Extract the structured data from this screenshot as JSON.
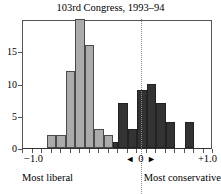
{
  "chart_data": {
    "type": "bar",
    "title": "103rd Congress, 1993–94",
    "xlabel": "",
    "ylabel": "",
    "xlim": [
      -1.0,
      1.0
    ],
    "ylim": [
      0,
      20
    ],
    "grid": false,
    "legend_position": "none",
    "bin_width": 0.1,
    "x_tick_labels": [
      "−1.0",
      "0",
      "+1.0"
    ],
    "y_tick_labels": [
      "0",
      "5",
      "10",
      "15"
    ],
    "y_ticks": [
      0,
      5,
      10,
      15
    ],
    "annotations": {
      "left_caption": "Most liberal",
      "right_caption": "Most conservative",
      "zero_marker": "0",
      "zero_marker_left_arrow": "◄",
      "zero_marker_right_arrow": "►"
    },
    "colors": {
      "liberal_fill": "#ababab",
      "conservative_fill": "#333333",
      "axis": "#555555",
      "zero_line": "#8a8a8a"
    },
    "series": [
      {
        "name": "Liberal (Democrats)",
        "color": "#ababab",
        "bins": [
          {
            "x0": -0.75,
            "x1": -0.65,
            "value": 2
          },
          {
            "x0": -0.65,
            "x1": -0.55,
            "value": 2
          },
          {
            "x0": -0.55,
            "x1": -0.45,
            "value": 12
          },
          {
            "x0": -0.45,
            "x1": -0.35,
            "value": 20
          },
          {
            "x0": -0.35,
            "x1": -0.25,
            "value": 16
          },
          {
            "x0": -0.25,
            "x1": -0.15,
            "value": 3
          },
          {
            "x0": -0.15,
            "x1": -0.05,
            "value": 2
          }
        ]
      },
      {
        "name": "Conservative (Republicans)",
        "color": "#333333",
        "bins": [
          {
            "x0": -0.05,
            "x1": 0.0,
            "value": 1
          },
          {
            "x0": 0.0,
            "x1": 0.1,
            "value": 7
          },
          {
            "x0": 0.1,
            "x1": 0.2,
            "value": 3
          },
          {
            "x0": 0.2,
            "x1": 0.3,
            "value": 9
          },
          {
            "x0": 0.3,
            "x1": 0.4,
            "value": 10
          },
          {
            "x0": 0.4,
            "x1": 0.5,
            "value": 7
          },
          {
            "x0": 0.5,
            "x1": 0.6,
            "value": 4
          },
          {
            "x0": 0.7,
            "x1": 0.8,
            "value": 4
          }
        ]
      }
    ]
  },
  "axis": {
    "y_labels": [
      {
        "value": 15,
        "text": "15"
      },
      {
        "value": 10,
        "text": "10"
      },
      {
        "value": 5,
        "text": "5"
      },
      {
        "value": 0,
        "text": "0"
      }
    ],
    "x_left": "−1.0",
    "x_right": "+1.0"
  }
}
